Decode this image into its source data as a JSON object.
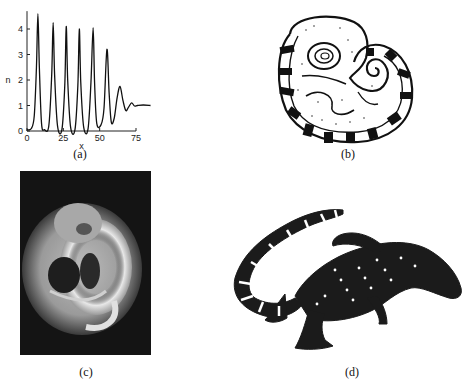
{
  "figure": {
    "panels": [
      {
        "id": "a",
        "label": "(a)",
        "kind": "line-plot"
      },
      {
        "id": "b",
        "label": "(b)",
        "kind": "line-drawing",
        "subject": "curled embryo with striped tail (illustration)"
      },
      {
        "id": "c",
        "label": "(c)",
        "kind": "photograph",
        "subject": "curled embryo, grayscale photo on dark background"
      },
      {
        "id": "d",
        "label": "(d)",
        "kind": "illustration",
        "subject": "alligator with banded pattern"
      }
    ]
  },
  "chart_data": {
    "type": "line",
    "title": "",
    "xlabel": "x",
    "ylabel": "n",
    "xlim": [
      0,
      85
    ],
    "ylim": [
      0,
      4.7
    ],
    "xticks": [
      0,
      25,
      50,
      75
    ],
    "yticks": [
      0,
      1,
      2,
      3,
      4
    ],
    "grid": false,
    "legend": null,
    "series": [
      {
        "name": "n(x)",
        "x": [
          0,
          3,
          5,
          6.5,
          7.5,
          8.5,
          10,
          12,
          15,
          17,
          18,
          19,
          21,
          24,
          26,
          27,
          28,
          30,
          33,
          35,
          36,
          37,
          39,
          42,
          44,
          45.5,
          46.5,
          48,
          51,
          53,
          55,
          56.5,
          58,
          60,
          62,
          64,
          66,
          68,
          70,
          72,
          74,
          76,
          80,
          85
        ],
        "y": [
          0.05,
          0.1,
          0.6,
          2.5,
          4.6,
          2.5,
          0.3,
          0.05,
          0.2,
          2.2,
          4.25,
          2.2,
          0.2,
          0.05,
          1.8,
          4.1,
          2.0,
          0.15,
          0.05,
          1.8,
          4.0,
          1.9,
          0.15,
          0.08,
          1.9,
          4.05,
          1.9,
          0.3,
          0.25,
          0.9,
          3.2,
          1.5,
          0.35,
          0.5,
          1.3,
          1.75,
          1.2,
          0.8,
          0.95,
          1.1,
          0.98,
          1.0,
          1.02,
          1.0
        ]
      }
    ],
    "annotations": [
      "(a)"
    ]
  }
}
